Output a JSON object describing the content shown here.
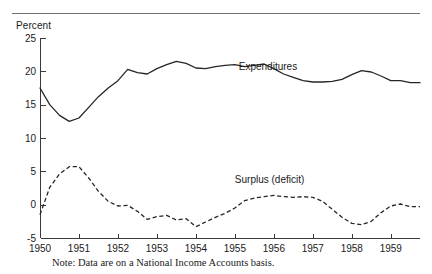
{
  "figure": {
    "y_axis_title": "Percent",
    "note": "Note: Data are on a National Income Accounts basis."
  },
  "chart_data": {
    "type": "line",
    "title": "",
    "subtitle": "",
    "xlabel": "",
    "ylabel": "Percent",
    "xlim": [
      1950.0,
      1959.75
    ],
    "ylim": [
      -5,
      25
    ],
    "grid": false,
    "legend": "inline-annotations",
    "x_tick_labels": [
      "1950",
      "1951",
      "1952",
      "1953",
      "1954",
      "1955",
      "1956",
      "1957",
      "1958",
      "1959"
    ],
    "x_ticks": [
      1950,
      1951,
      1952,
      1953,
      1954,
      1955,
      1956,
      1957,
      1958,
      1959
    ],
    "y_tick_labels": [
      "25",
      "20",
      "15",
      "10",
      "5",
      "0",
      "-5"
    ],
    "y_ticks": [
      25,
      20,
      15,
      10,
      5,
      0,
      -5
    ],
    "annotations": [
      {
        "text": "Expenditures",
        "x": 1955.1,
        "y": 20.2
      },
      {
        "text": "Surplus (deficit)",
        "x": 1955.0,
        "y": 3.3
      }
    ],
    "series": [
      {
        "name": "Expenditures",
        "style": "solid",
        "x": [
          1950.0,
          1950.25,
          1950.5,
          1950.75,
          1951.0,
          1951.25,
          1951.5,
          1951.75,
          1952.0,
          1952.25,
          1952.5,
          1952.75,
          1953.0,
          1953.25,
          1953.5,
          1953.75,
          1954.0,
          1954.25,
          1954.5,
          1954.75,
          1955.0,
          1955.25,
          1955.5,
          1955.75,
          1956.0,
          1956.25,
          1956.5,
          1956.75,
          1957.0,
          1957.25,
          1957.5,
          1957.75,
          1958.0,
          1958.25,
          1958.5,
          1958.75,
          1959.0,
          1959.25,
          1959.5,
          1959.75
        ],
        "values": [
          17.5,
          15.0,
          13.4,
          12.5,
          13.0,
          14.6,
          16.2,
          17.5,
          18.6,
          20.3,
          19.8,
          19.6,
          20.4,
          21.0,
          21.5,
          21.2,
          20.5,
          20.4,
          20.7,
          20.9,
          21.0,
          20.7,
          20.9,
          21.1,
          20.4,
          19.6,
          19.1,
          18.6,
          18.4,
          18.4,
          18.5,
          18.8,
          19.5,
          20.1,
          19.9,
          19.3,
          18.6,
          18.6,
          18.3,
          18.3
        ]
      },
      {
        "name": "Surplus (deficit)",
        "style": "dashed",
        "x": [
          1950.0,
          1950.25,
          1950.5,
          1950.75,
          1951.0,
          1951.25,
          1951.5,
          1951.75,
          1952.0,
          1952.25,
          1952.5,
          1952.75,
          1953.0,
          1953.25,
          1953.5,
          1953.75,
          1954.0,
          1954.25,
          1954.5,
          1954.75,
          1955.0,
          1955.25,
          1955.5,
          1955.75,
          1956.0,
          1956.25,
          1956.5,
          1956.75,
          1957.0,
          1957.25,
          1957.5,
          1957.75,
          1958.0,
          1958.25,
          1958.5,
          1958.75,
          1959.0,
          1959.25,
          1959.5,
          1959.75
        ],
        "values": [
          -1.5,
          2.6,
          4.6,
          5.7,
          5.7,
          4.0,
          2.0,
          0.5,
          -0.2,
          -0.1,
          -1.0,
          -2.2,
          -1.8,
          -1.6,
          -2.3,
          -2.1,
          -3.3,
          -2.6,
          -1.9,
          -1.3,
          -0.5,
          0.6,
          1.0,
          1.2,
          1.4,
          1.2,
          1.1,
          1.2,
          1.1,
          0.5,
          -0.7,
          -1.9,
          -2.8,
          -3.0,
          -2.5,
          -1.2,
          -0.2,
          0.1,
          -0.3,
          -0.3
        ]
      }
    ]
  }
}
